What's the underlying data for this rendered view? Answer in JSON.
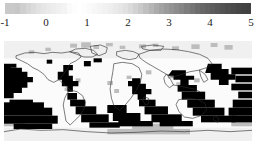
{
  "figure": {
    "type": "map-with-colorbar",
    "background": "#ffffff"
  },
  "colorbar": {
    "name": "grayscale-colorbar",
    "orientation": "horizontal",
    "vmin": -1,
    "vmax": 5,
    "tick_labels": [
      "-1",
      "0",
      "1",
      "2",
      "3",
      "4",
      "5"
    ],
    "tick_values": [
      -1,
      0,
      1,
      2,
      3,
      4,
      5
    ],
    "label_color": "#1a1a1a",
    "segment_colors": [
      "#c9c9c9",
      "#c9c9c9",
      "#c6c6c6",
      "#cfcfcf",
      "#d6d6d6",
      "#dcdcdc",
      "#e2e2e2",
      "#e6e6e6",
      "#eaeaea",
      "#ededed",
      "#f0f0f0",
      "#f3f3f3",
      "#fafafa",
      "#fdfdfd",
      "#ffffff",
      "#fdfdfd",
      "#fafafa",
      "#f7f7f7",
      "#f4f4f4",
      "#f1f1f1",
      "#eeeeee",
      "#eaeaea",
      "#e6e6e6",
      "#e1e1e1",
      "#dadada",
      "#d2d2d2",
      "#c9c9c9",
      "#bfbfbf",
      "#b5b5b5",
      "#ababab",
      "#a2a2a2",
      "#9a9a9a",
      "#939393",
      "#8c8c8c",
      "#858585",
      "#7d7d7d",
      "#757575",
      "#6d6d6d",
      "#676767",
      "#626262",
      "#5d5d5d",
      "#585858",
      "#535353",
      "#4e4e4e",
      "#4a4a4a",
      "#464646",
      "#434343",
      "#414141"
    ]
  },
  "map": {
    "name": "world-grid-map",
    "projection": "equirectangular",
    "land_outline_color": "#2b2b2b",
    "high_value_cell_color": "#000000",
    "mid_value_cell_color": "#9a9a9a",
    "low_value_cell_color": "#f2f2f2",
    "ocean_background": "#fbfbfb",
    "regions": [
      "North Atlantic",
      "North Pacific",
      "Southern Ocean",
      "Indian Ocean",
      "Equatorial Pacific",
      "Antarctica"
    ]
  },
  "chart_data": {
    "type": "heatmap",
    "title": "",
    "xlabel": "",
    "ylabel": "",
    "colorbar_label": "",
    "vmin": -1,
    "vmax": 5,
    "tick_labels": [
      "-1",
      "0",
      "1",
      "2",
      "3",
      "4",
      "5"
    ],
    "colormap": "grayscale",
    "grid": true,
    "legend_position": "top"
  }
}
